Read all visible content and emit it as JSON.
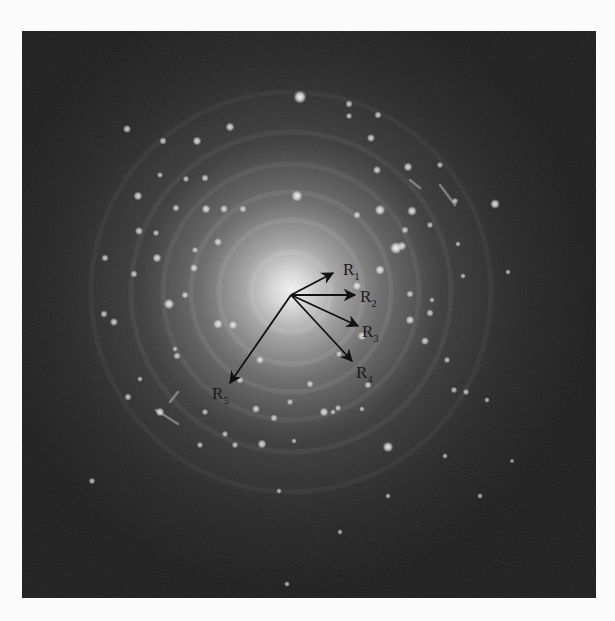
{
  "figure": {
    "type": "electron diffraction pattern (SAED)",
    "background_color": "#fbfbfb",
    "pattern_bg_color": "#1c1c1c",
    "frame": {
      "x": 22,
      "y": 31,
      "width": 574,
      "height": 567
    },
    "center": {
      "x": 291,
      "y": 295
    },
    "rings_radii": [
      40,
      72,
      100,
      128,
      160,
      200
    ],
    "vectors": [
      {
        "id": "R1",
        "base": "R",
        "sub": "1",
        "tip": [
          333,
          273
        ],
        "label_pos": [
          343,
          275
        ]
      },
      {
        "id": "R2",
        "base": "R",
        "sub": "2",
        "tip": [
          355,
          295
        ],
        "label_pos": [
          360,
          302
        ]
      },
      {
        "id": "R3",
        "base": "R",
        "sub": "3",
        "tip": [
          358,
          326
        ],
        "label_pos": [
          362,
          337
        ]
      },
      {
        "id": "R4",
        "base": "R",
        "sub": "4",
        "tip": [
          352,
          361
        ],
        "label_pos": [
          356,
          378
        ]
      },
      {
        "id": "R5",
        "base": "R",
        "sub": "5",
        "tip": [
          230,
          383
        ],
        "label_pos": [
          212,
          399
        ]
      }
    ],
    "spots": [
      [
        300,
        97,
        3.2
      ],
      [
        230,
        127,
        2.2
      ],
      [
        197,
        141,
        2.2
      ],
      [
        127,
        129,
        2
      ],
      [
        163,
        141,
        1.8
      ],
      [
        138,
        196,
        2.2
      ],
      [
        206,
        209,
        2.2
      ],
      [
        224,
        209,
        2
      ],
      [
        243,
        209,
        1.8
      ],
      [
        297,
        196,
        2.8
      ],
      [
        176,
        208,
        1.8
      ],
      [
        186,
        179,
        1.6
      ],
      [
        205,
        178,
        1.8
      ],
      [
        160,
        175,
        1.5
      ],
      [
        139,
        231,
        2
      ],
      [
        156,
        233,
        1.6
      ],
      [
        105,
        258,
        1.8
      ],
      [
        157,
        258,
        2.2
      ],
      [
        134,
        274,
        1.8
      ],
      [
        195,
        250,
        1.6
      ],
      [
        218,
        242,
        2
      ],
      [
        104,
        314,
        1.8
      ],
      [
        169,
        304,
        2.6
      ],
      [
        194,
        268,
        2
      ],
      [
        185,
        295,
        1.8
      ],
      [
        177,
        356,
        1.8
      ],
      [
        218,
        324,
        2.4
      ],
      [
        233,
        325,
        2.2
      ],
      [
        349,
        104,
        1.8
      ],
      [
        349,
        116,
        1.6
      ],
      [
        378,
        115,
        1.8
      ],
      [
        371,
        138,
        2
      ],
      [
        377,
        170,
        2
      ],
      [
        408,
        167,
        2.2
      ],
      [
        440,
        165,
        1.6
      ],
      [
        380,
        210,
        2.6
      ],
      [
        357,
        215,
        1.8
      ],
      [
        412,
        211,
        2.4
      ],
      [
        455,
        201,
        1.6
      ],
      [
        495,
        204,
        2.4
      ],
      [
        405,
        230,
        1.8
      ],
      [
        402,
        246,
        2.2
      ],
      [
        430,
        225,
        1.6
      ],
      [
        458,
        244,
        1.4
      ],
      [
        396,
        248,
        3
      ],
      [
        380,
        270,
        2.4
      ],
      [
        357,
        286,
        2.2
      ],
      [
        410,
        294,
        1.8
      ],
      [
        432,
        300,
        1.4
      ],
      [
        463,
        276,
        1.4
      ],
      [
        508,
        272,
        1.4
      ],
      [
        430,
        313,
        1.8
      ],
      [
        410,
        320,
        2.2
      ],
      [
        425,
        341,
        2
      ],
      [
        447,
        360,
        1.6
      ],
      [
        466,
        392,
        1.6
      ],
      [
        487,
        400,
        1.4
      ],
      [
        454,
        390,
        1.6
      ],
      [
        368,
        385,
        1.8
      ],
      [
        362,
        336,
        2.2
      ],
      [
        339,
        354,
        1.6
      ],
      [
        310,
        384,
        1.8
      ],
      [
        324,
        412,
        2.2
      ],
      [
        338,
        408,
        1.6
      ],
      [
        362,
        409,
        1.4
      ],
      [
        388,
        447,
        2.6
      ],
      [
        333,
        412,
        1.4
      ],
      [
        290,
        402,
        1.6
      ],
      [
        274,
        418,
        1.8
      ],
      [
        294,
        441,
        1.4
      ],
      [
        256,
        409,
        2
      ],
      [
        260,
        360,
        2
      ],
      [
        240,
        380,
        1.8
      ],
      [
        205,
        412,
        1.6
      ],
      [
        225,
        434,
        1.6
      ],
      [
        262,
        444,
        2.2
      ],
      [
        235,
        445,
        1.6
      ],
      [
        200,
        445,
        1.6
      ],
      [
        175,
        349,
        1.4
      ],
      [
        160,
        412,
        2.2
      ],
      [
        128,
        397,
        1.8
      ],
      [
        114,
        322,
        2
      ],
      [
        140,
        379,
        1.4
      ],
      [
        92,
        481,
        1.6
      ],
      [
        279,
        491,
        1.4
      ],
      [
        340,
        532,
        1.4
      ],
      [
        287,
        584,
        1.4
      ],
      [
        445,
        456,
        1.4
      ],
      [
        388,
        496,
        1.4
      ],
      [
        480,
        496,
        1.4
      ],
      [
        512,
        461,
        1.2
      ]
    ],
    "streaks": [
      [
        156,
        410,
        178,
        424
      ],
      [
        178,
        392,
        170,
        402
      ],
      [
        410,
        180,
        420,
        188
      ],
      [
        440,
        185,
        455,
        205
      ]
    ]
  }
}
